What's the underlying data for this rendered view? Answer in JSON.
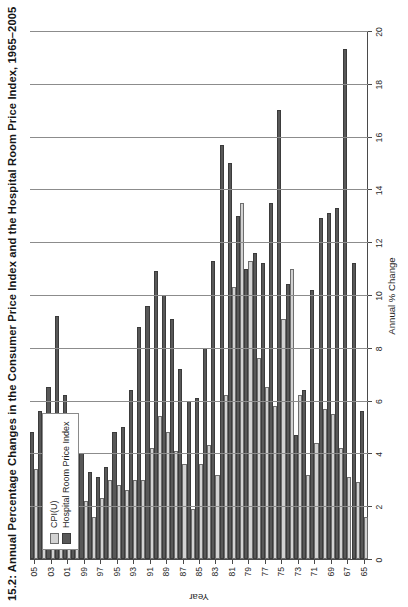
{
  "chart_data": {
    "type": "bar",
    "orientation": "horizontal",
    "title": "15.2: Annual Percentage Changes in the Consumer Price Index and the Hospital Room Price Index, 1965–2005",
    "xlabel": "Year",
    "ylabel": "Annual % Change",
    "ylim": [
      0,
      20
    ],
    "yticks": [
      "0",
      "2",
      "4",
      "6",
      "8",
      "10",
      "12",
      "14",
      "16",
      "18",
      "20"
    ],
    "grid": true,
    "legend_position": "top-left",
    "categories": [
      "65",
      "66",
      "67",
      "68",
      "69",
      "70",
      "71",
      "72",
      "73",
      "74",
      "75",
      "76",
      "77",
      "78",
      "79",
      "80",
      "81",
      "82",
      "83",
      "84",
      "85",
      "86",
      "87",
      "88",
      "89",
      "90",
      "91",
      "92",
      "93",
      "94",
      "95",
      "96",
      "97",
      "98",
      "99",
      "00",
      "01",
      "02",
      "03",
      "04",
      "05"
    ],
    "tick_labels": [
      "65",
      "67",
      "69",
      "71",
      "73",
      "75",
      "77",
      "79",
      "81",
      "83",
      "85",
      "87",
      "89",
      "91",
      "93",
      "95",
      "97",
      "99",
      "01",
      "03",
      "05"
    ],
    "series": [
      {
        "name": "CPI(U)",
        "color": "#d2d2d2",
        "values": [
          1.6,
          2.9,
          3.1,
          4.2,
          5.5,
          5.7,
          4.4,
          3.2,
          6.2,
          11.0,
          9.1,
          5.8,
          6.5,
          7.6,
          11.3,
          13.5,
          10.3,
          6.2,
          3.2,
          4.3,
          3.6,
          1.9,
          3.6,
          4.1,
          4.8,
          5.4,
          4.2,
          3.0,
          3.0,
          2.6,
          2.8,
          3.0,
          2.3,
          1.6,
          2.2,
          3.4,
          2.8,
          1.6,
          2.3,
          2.7,
          3.4
        ]
      },
      {
        "name": "Hospital Room Price Index",
        "color": "#585858",
        "values": [
          5.6,
          11.2,
          19.3,
          13.3,
          13.1,
          12.9,
          10.2,
          6.4,
          4.7,
          10.4,
          17.0,
          13.5,
          11.2,
          11.6,
          11.0,
          13.0,
          15.0,
          15.7,
          11.3,
          8.0,
          6.1,
          6.0,
          7.2,
          9.1,
          10.0,
          10.9,
          9.6,
          8.8,
          6.4,
          5.0,
          4.8,
          3.5,
          3.1,
          3.3,
          4.0,
          5.1,
          6.2,
          9.2,
          6.5,
          5.6,
          4.8
        ]
      }
    ]
  },
  "legend": {
    "items": [
      {
        "label": "CPI(U)",
        "key": "cpi"
      },
      {
        "label": "Hospital Room Price Index",
        "key": "hosp"
      }
    ]
  },
  "colors": {
    "cpi_bar": "#d2d2d2",
    "hospital_bar": "#585858",
    "axis": "#4a4a4a",
    "grid": "#8c8c8c",
    "background": "#ffffff"
  }
}
